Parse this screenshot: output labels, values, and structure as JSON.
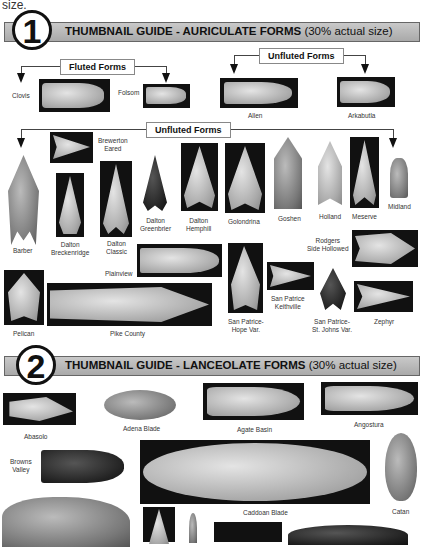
{
  "lead_text": "size.",
  "section1": {
    "number": "1",
    "title": "THUMBNAIL GUIDE - AURICULATE FORMS",
    "subtitle": "(30% actual size)",
    "fluted_label": "Fluted Forms",
    "unfluted_top_label": "Unfluted Forms",
    "unfluted_mid_label": "Unfluted Forms",
    "items": {
      "clovis": "Clovis",
      "folsom": "Folsom",
      "allen": "Allen",
      "arkabutla": "Arkabutla",
      "brewerton": "Brewerton\nEared",
      "barber": "Barber",
      "dalton_breckenridge": "Dalton\nBreckenridge",
      "dalton_classic": "Dalton\nClassic",
      "dalton_greenbrier": "Dalton\nGreenbrier",
      "dalton_hemphill": "Dalton\nHemphill",
      "golondrina": "Golondrina",
      "goshen": "Goshen",
      "holland": "Holland",
      "meserve": "Meserve",
      "midland": "Midland",
      "rodgers": "Rodgers\nSide Hollowed",
      "plainview": "Plainview",
      "pelican": "Pelican",
      "pike_county": "Pike County",
      "san_patrice_hope": "San Patrice-\nHope Var.",
      "san_patrice_keithville": "San Patrice\nKeithville",
      "san_patrice_st_johns": "San Patrice-\nSt. Johns Var.",
      "zephyr": "Zephyr"
    }
  },
  "section2": {
    "number": "2",
    "title": "THUMBNAIL GUIDE - LANCEOLATE FORMS",
    "subtitle": "(30% actual size)",
    "items": {
      "abasolo": "Abasolo",
      "adena_blade": "Adena Blade",
      "agate_basin": "Agate Basin",
      "angostura": "Angostura",
      "browns_valley": "Browns\nValley",
      "caddoan_blade": "Caddoan Blade",
      "catan": "Catan"
    }
  }
}
